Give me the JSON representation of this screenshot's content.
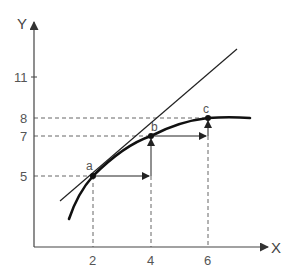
{
  "diagram": {
    "axes": {
      "x_label": "X",
      "y_label": "Y"
    },
    "x_ticks": [
      {
        "label": "2",
        "value": 2
      },
      {
        "label": "4",
        "value": 4
      },
      {
        "label": "6",
        "value": 6
      }
    ],
    "y_ticks": [
      {
        "label": "11",
        "value": 11
      },
      {
        "label": "8",
        "value": 8
      },
      {
        "label": "7",
        "value": 7
      },
      {
        "label": "5",
        "value": 5
      }
    ],
    "points": [
      {
        "label": "a",
        "x": 2,
        "y": 5
      },
      {
        "label": "b",
        "x": 4,
        "y": 7
      },
      {
        "label": "c",
        "x": 6,
        "y": 8
      }
    ],
    "elements": {
      "curve": "concave increasing curve through a, b, c",
      "tangent_line": "straight line tangent to curve at a, extending upward",
      "arrows": [
        {
          "from": "a",
          "direction": "right",
          "to_x": 4
        },
        {
          "from": "x=4",
          "direction": "up",
          "to": "b"
        },
        {
          "from": "b",
          "direction": "right",
          "to_x": 6
        },
        {
          "from": "x=6",
          "direction": "up",
          "to": "c"
        }
      ]
    },
    "colors": {
      "line": "#222222",
      "axis": "#555555",
      "dashed": "#666666",
      "text": "#555555"
    }
  }
}
